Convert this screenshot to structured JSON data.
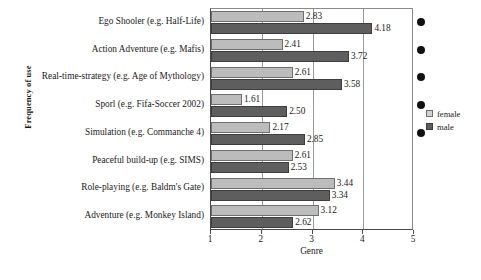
{
  "chart_data": {
    "type": "bar",
    "orientation": "horizontal",
    "title": "",
    "xlabel": "Genre",
    "ylabel": "Frequency of use",
    "xlim": [
      1,
      5
    ],
    "xticks": [
      1,
      2,
      3,
      4,
      5
    ],
    "grid": true,
    "legend_position": "right",
    "categories": [
      "Ego Shooler (e.g. Half-Life)",
      "Action Adventure (e.g. Mafis)",
      "Real-time-strategy (e.g. Age of Mythology)",
      "Sporl (e.g. Fifa-Soccer 2002)",
      "Simulation (e.g. Commanche 4)",
      "Peaceful build-up (e.g. SIMS)",
      "Role-playing (e.g. Baldm's Gate)",
      "Adventure (e.g. Monkey Island)"
    ],
    "series": [
      {
        "name": "female",
        "color": "#bcbcbc",
        "values": [
          2.83,
          2.41,
          2.61,
          1.61,
          2.17,
          2.61,
          3.44,
          3.12
        ],
        "labels": [
          "2.83",
          "2.41",
          "2.61",
          "1.61",
          "2.17",
          "2.61",
          "3.44",
          "3.12"
        ]
      },
      {
        "name": "male",
        "color": "#5e5e5e",
        "values": [
          4.18,
          3.72,
          3.58,
          2.5,
          2.85,
          2.53,
          3.34,
          2.62
        ],
        "labels": [
          "4.18",
          "3.72",
          "3.58",
          "2.50",
          "2.85",
          "2.53",
          "3.34",
          "2.62"
        ]
      }
    ],
    "annotations": {
      "significance_marker": "filled-black-dot",
      "marked_categories": [
        "Ego Shooler (e.g. Half-Life)",
        "Action Adventure (e.g. Mafis)",
        "Real-time-strategy (e.g. Age of Mythology)",
        "Sporl (e.g. Fifa-Soccer 2002)",
        "Simulation (e.g. Commanche 4)"
      ]
    }
  },
  "legend": {
    "items": [
      {
        "label": "female"
      },
      {
        "label": "male"
      }
    ]
  },
  "caption": {
    "text": ""
  }
}
